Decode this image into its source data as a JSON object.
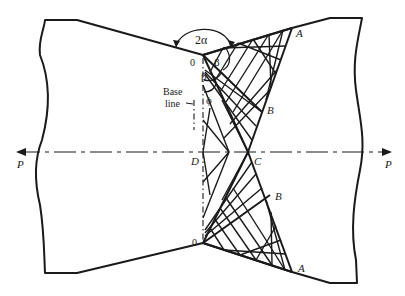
{
  "figure": {
    "type": "slip-line field diagram (plane strain indentation / compression of wedge-notched plate)",
    "points": {
      "O_top": "0",
      "O_bottom": "0",
      "A_top": "A",
      "A_bottom": "A",
      "B_top": "B",
      "B_bottom": "B",
      "C": "C",
      "D": "D"
    },
    "angles": {
      "notch_angle": "2α",
      "beta_upper": "β",
      "beta_lower": "β",
      "phi": "ϕ"
    },
    "annotations": {
      "base_line_1": "Base",
      "base_line_2": "line"
    },
    "forces": {
      "left": "P",
      "right": "P"
    },
    "colors": {
      "ink": "#1a1a1a",
      "background": "#ffffff"
    }
  }
}
